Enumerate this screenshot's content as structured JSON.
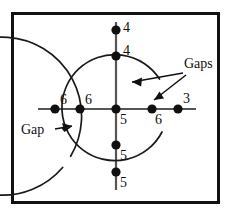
{
  "figure": {
    "frame": {
      "border_color": "#111111",
      "background": "#ffffff"
    },
    "stroke_color": "#1a1a1a",
    "point_color": "#101010"
  },
  "axes": {
    "horizontal": {
      "name": "horizontal-axis"
    },
    "vertical": {
      "name": "vertical-axis"
    }
  },
  "circles": [
    {
      "name": "outer-circle",
      "gap_label": "Gap",
      "gap_position": "lower-left"
    },
    {
      "name": "inner-circle",
      "gap_label": "Gaps",
      "gap_position": "upper-right"
    }
  ],
  "points": [
    {
      "id": "top-outer",
      "label": "4",
      "x": 116,
      "y": 30
    },
    {
      "id": "top-inner",
      "label": "4",
      "x": 116,
      "y": 56
    },
    {
      "id": "left-outer",
      "label": "6",
      "x": 55,
      "y": 109
    },
    {
      "id": "left-inner",
      "label": "6",
      "x": 80,
      "y": 109
    },
    {
      "id": "center",
      "label": "5",
      "x": 116,
      "y": 109
    },
    {
      "id": "right-inner",
      "label": "6",
      "x": 152,
      "y": 109
    },
    {
      "id": "right-outer",
      "label": "3",
      "x": 178,
      "y": 109
    },
    {
      "id": "bottom-inner",
      "label": "5",
      "x": 116,
      "y": 145
    },
    {
      "id": "bottom-outer",
      "label": "5",
      "x": 116,
      "y": 172
    }
  ],
  "annotations": [
    {
      "id": "gaps-callout",
      "text": "Gaps",
      "x": 186,
      "y": 62
    },
    {
      "id": "gap-callout",
      "text": "Gap",
      "x": 32,
      "y": 130
    }
  ],
  "point_labels": {
    "top_outer": "4",
    "top_inner": "4",
    "left_outer": "6",
    "left_inner": "6",
    "center": "5",
    "right_inner": "6",
    "right_outer": "3",
    "bottom_inner": "5",
    "bottom_outer": "5"
  },
  "annotation_text": {
    "gaps": "Gaps",
    "gap": "Gap"
  }
}
